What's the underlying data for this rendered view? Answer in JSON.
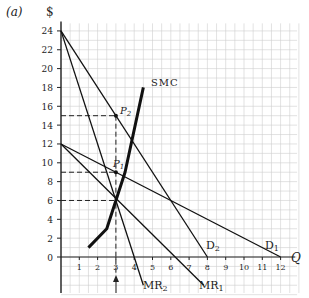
{
  "figure": {
    "panel_label": "(a)",
    "ylabel": "$",
    "xlabel": "Q"
  },
  "chart_data": {
    "type": "line",
    "title": "",
    "panel_label": "(a)",
    "xlabel": "Q",
    "ylabel": "$",
    "xlim": [
      0,
      12.5
    ],
    "ylim": [
      0,
      24
    ],
    "xticks": [
      1,
      2,
      3,
      4,
      5,
      6,
      7,
      8,
      9,
      10,
      11,
      12
    ],
    "yticks": [
      0,
      2,
      4,
      6,
      8,
      10,
      12,
      14,
      16,
      18,
      20,
      22,
      24
    ],
    "grid": true,
    "series": [
      {
        "name": "D1",
        "label": "D₁",
        "points": [
          [
            0,
            12
          ],
          [
            12,
            0
          ]
        ]
      },
      {
        "name": "D2",
        "label": "D₂",
        "points": [
          [
            0,
            24
          ],
          [
            8,
            0
          ]
        ]
      },
      {
        "name": "MR1",
        "label": "MR₁",
        "points": [
          [
            0,
            12
          ],
          [
            7.8,
            -3
          ]
        ]
      },
      {
        "name": "MR2",
        "label": "MR₂",
        "points": [
          [
            0,
            24
          ],
          [
            4.5,
            -3
          ]
        ]
      },
      {
        "name": "SMC",
        "label": "SMC",
        "points": [
          [
            1.5,
            1
          ],
          [
            2.5,
            3
          ],
          [
            3,
            6
          ],
          [
            3.5,
            9
          ],
          [
            4.5,
            18
          ]
        ]
      }
    ],
    "annotations": [
      {
        "label": "P₂",
        "x": 3,
        "y": 15
      },
      {
        "label": "P₁",
        "x": 3,
        "y": 9
      },
      {
        "label": "dashed guide",
        "y": 15,
        "x_to": 3
      },
      {
        "label": "dashed guide",
        "y": 9,
        "x_to": 3
      },
      {
        "label": "dashed guide",
        "y": 6,
        "x_to": 3
      },
      {
        "label": "arrow at Q=3",
        "x": 3
      }
    ]
  },
  "labels": {
    "smc": "SMC",
    "p2": "P",
    "p2sub": "2",
    "p1": "P",
    "p1sub": "1",
    "d1": "D",
    "d1sub": "1",
    "d2": "D",
    "d2sub": "2",
    "mr1": "MR",
    "mr1sub": "1",
    "mr2": "MR",
    "mr2sub": "2"
  }
}
